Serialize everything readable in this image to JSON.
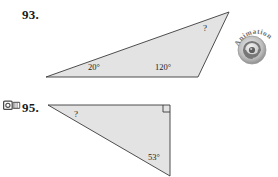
{
  "page": {
    "width": 278,
    "height": 177,
    "background_color": "#ffffff",
    "content_type": "textbook-exercise-figures"
  },
  "style": {
    "triangle_fill": "#e3e3e3",
    "triangle_stroke": "#3b3b3b",
    "text_color": "#1c1c1c",
    "badge_color": "#9a9a9a"
  },
  "problems": [
    {
      "number": "93.",
      "figure": {
        "shape": "triangle",
        "kind": "obtuse-scalene",
        "vertices": [
          {
            "name": "bottom-left",
            "x": 46,
            "y": 77
          },
          {
            "name": "bottom-right",
            "x": 198,
            "y": 77
          },
          {
            "name": "apex-right",
            "x": 229,
            "y": 12
          }
        ],
        "labels": [
          {
            "name": "angle-20",
            "text": "20°",
            "x": 88,
            "y": 65
          },
          {
            "name": "angle-120",
            "text": "120°",
            "x": 157,
            "y": 65
          },
          {
            "name": "angle-unknown",
            "text": "?",
            "x": 203,
            "y": 28
          }
        ]
      }
    },
    {
      "number": "95.",
      "icon": "video-camera-icon",
      "figure": {
        "shape": "triangle",
        "kind": "right-triangle",
        "vertices": [
          {
            "name": "top-left",
            "x": 48,
            "y": 105
          },
          {
            "name": "top-right",
            "x": 170,
            "y": 105
          },
          {
            "name": "bottom-right",
            "x": 170,
            "y": 176
          }
        ],
        "right_angle_marker": {
          "corner": "top-right",
          "size": 7
        },
        "labels": [
          {
            "name": "angle-unknown",
            "text": "?",
            "x": 75,
            "y": 112
          },
          {
            "name": "angle-53",
            "text": "53°",
            "x": 150,
            "y": 156
          }
        ]
      }
    }
  ],
  "badges": {
    "animation": {
      "label": "Animation",
      "icon": "spiral-icon"
    }
  }
}
